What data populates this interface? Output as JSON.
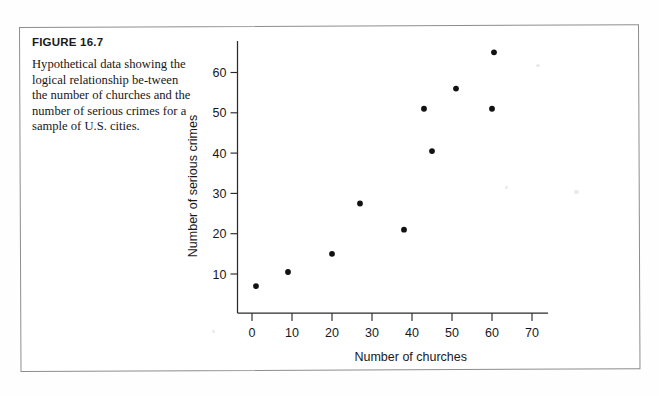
{
  "figure": {
    "number_label": "FIGURE 16.7",
    "caption": "Hypothetical data showing the logical relationship be-tween the number of churches and the number of serious crimes for a sample of U.S. cities."
  },
  "chart_data": {
    "type": "scatter",
    "title": "",
    "xlabel": "Number of churches",
    "ylabel": "Number of serious crimes",
    "xlim": [
      -3,
      74
    ],
    "ylim": [
      0,
      68
    ],
    "xticks": [
      0,
      10,
      20,
      30,
      40,
      50,
      60,
      70
    ],
    "yticks": [
      10,
      20,
      30,
      40,
      50,
      60
    ],
    "xticklabels": [
      "0",
      "10",
      "20",
      "30",
      "40",
      "50",
      "60",
      "70"
    ],
    "yticklabels": [
      "10",
      "20",
      "30",
      "40",
      "50",
      "60"
    ],
    "grid": false,
    "legend": false,
    "marker": "filled-circle",
    "marker_color": "#121212",
    "points": [
      {
        "x": 1,
        "y": 7
      },
      {
        "x": 9,
        "y": 10.5
      },
      {
        "x": 20,
        "y": 15
      },
      {
        "x": 27,
        "y": 27.5
      },
      {
        "x": 38,
        "y": 21
      },
      {
        "x": 43,
        "y": 51
      },
      {
        "x": 45,
        "y": 40.5
      },
      {
        "x": 51,
        "y": 56
      },
      {
        "x": 60,
        "y": 51
      },
      {
        "x": 60.5,
        "y": 65
      }
    ]
  },
  "colors": {
    "ink": "#18181b",
    "axis": "#2b2b2b",
    "box_border": "#8d8d8d",
    "page_background": "#fefefe"
  }
}
